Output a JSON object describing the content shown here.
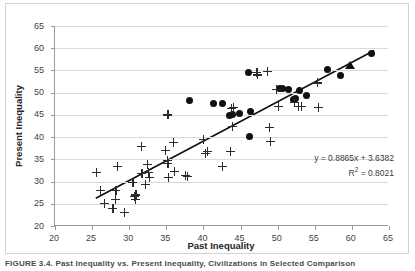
{
  "figure": {
    "caption": "FIGURE 3.4.  Past Inequality vs. Present Inequality, Civilizations in Selected Comparison"
  },
  "chart_data": {
    "type": "scatter",
    "title": "",
    "xlabel": "Past Inequality",
    "ylabel": "Present Inequality",
    "xlim": [
      20,
      65
    ],
    "ylim": [
      20,
      65
    ],
    "xticks": [
      20,
      25,
      30,
      35,
      40,
      45,
      50,
      55,
      60,
      65
    ],
    "yticks": [
      20,
      25,
      30,
      35,
      40,
      45,
      50,
      55,
      60,
      65
    ],
    "grid": "horizontal",
    "legend": "none",
    "trendline": {
      "equation": "y = 0.8865x + 3.6382",
      "r_squared_label": "R",
      "r_squared_sup": "2",
      "r_squared_value": " = 0.8021",
      "slope": 0.8865,
      "intercept": 3.6382,
      "r2": 0.8021,
      "x_start": 25.5,
      "x_end": 63.0
    },
    "series": [
      {
        "name": "circles",
        "marker": "circle",
        "points": [
          [
            38.1,
            48.2
          ],
          [
            41.4,
            47.6
          ],
          [
            42.6,
            47.5
          ],
          [
            43.5,
            44.8
          ],
          [
            43.9,
            45.0
          ],
          [
            44.8,
            45.4
          ],
          [
            46.1,
            54.6
          ],
          [
            46.2,
            40.1
          ],
          [
            46.3,
            45.7
          ],
          [
            50.2,
            51.0
          ],
          [
            50.6,
            50.9
          ],
          [
            51.5,
            50.8
          ],
          [
            52.1,
            48.4
          ],
          [
            52.4,
            48.6
          ],
          [
            53.0,
            50.4
          ],
          [
            53.9,
            49.3
          ],
          [
            56.7,
            55.2
          ],
          [
            58.5,
            53.9
          ],
          [
            62.6,
            58.9
          ]
        ]
      },
      {
        "name": "plus",
        "marker": "plus",
        "points": [
          [
            25.6,
            32.0
          ],
          [
            26.1,
            28.0
          ],
          [
            26.7,
            25.0
          ],
          [
            27.8,
            24.0
          ],
          [
            28.1,
            26.0
          ],
          [
            28.2,
            28.0
          ],
          [
            28.4,
            33.5
          ],
          [
            29.4,
            23.0
          ],
          [
            30.5,
            29.9
          ],
          [
            30.7,
            26.7
          ],
          [
            30.8,
            26.0
          ],
          [
            30.9,
            27.0
          ],
          [
            31.6,
            38.0
          ],
          [
            31.7,
            31.9
          ],
          [
            32.2,
            29.3
          ],
          [
            32.5,
            33.8
          ],
          [
            32.6,
            32.1
          ],
          [
            32.7,
            31.0
          ],
          [
            34.9,
            37.1
          ],
          [
            35.1,
            34.7
          ],
          [
            35.2,
            45.0
          ],
          [
            35.2,
            34.0
          ],
          [
            35.3,
            30.9
          ],
          [
            35.9,
            38.9
          ],
          [
            36.1,
            32.3
          ],
          [
            37.6,
            31.3
          ],
          [
            37.8,
            31.2
          ],
          [
            40.0,
            39.4
          ],
          [
            40.3,
            36.4
          ],
          [
            40.5,
            36.8
          ],
          [
            42.5,
            33.4
          ],
          [
            43.6,
            36.7
          ],
          [
            43.8,
            46.4
          ],
          [
            43.9,
            42.5
          ],
          [
            44.0,
            46.6
          ],
          [
            47.2,
            54.6
          ],
          [
            47.3,
            54.0
          ],
          [
            48.6,
            54.8
          ],
          [
            48.9,
            42.1
          ],
          [
            49.0,
            39.1
          ],
          [
            49.8,
            50.8
          ],
          [
            50.1,
            46.9
          ],
          [
            52.3,
            47.8
          ],
          [
            52.8,
            46.9
          ],
          [
            53.2,
            47.0
          ],
          [
            55.3,
            52.2
          ],
          [
            55.5,
            46.7
          ]
        ]
      },
      {
        "name": "triangle",
        "marker": "triangle",
        "points": [
          [
            59.8,
            56.2
          ]
        ]
      }
    ]
  }
}
